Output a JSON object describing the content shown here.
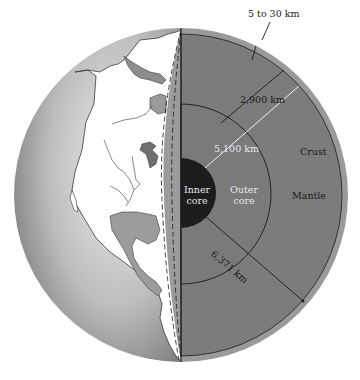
{
  "figure": {
    "layers": [
      {
        "name": "crust",
        "label": "Crust",
        "thickness": "5 to 30 km"
      },
      {
        "name": "mantle",
        "label": "Mantle",
        "thickness": "2,900 km"
      },
      {
        "name": "outer_core",
        "label": "Outer core"
      },
      {
        "name": "inner_core",
        "label": "Inner core"
      }
    ],
    "labels": {
      "crust_thickness": "5 to 30 km",
      "mantle_thickness": "2,900 km",
      "core_radius": "5,100 km",
      "earth_radius": "6,371 km",
      "crust": "Crust",
      "mantle": "Mantle",
      "outer_core_line1": "Outer",
      "outer_core_line2": "core",
      "inner_core_line1": "Inner",
      "inner_core_line2": "core"
    },
    "colors": {
      "background": "#ffffff",
      "crust": "#9a9a9a",
      "mantle": "#7c7c7c",
      "outer_core": "#7a7a7a",
      "inner_core": "#1c1c1c",
      "globe_ocean_light": "#d9d9d9",
      "globe_ocean_dark": "#6e6e6e",
      "land": "#ffffff",
      "line": "#1a1a1a",
      "radius_line": "#f0f0f0"
    }
  }
}
